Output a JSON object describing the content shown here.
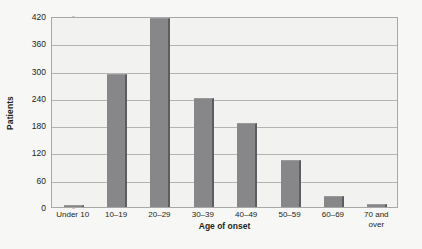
{
  "chart_data": {
    "type": "bar",
    "title": "",
    "xlabel": "Age of onset",
    "ylabel": "Patients",
    "categories": [
      "Under 10",
      "10–19",
      "20–29",
      "30–39",
      "40–49",
      "50–59",
      "60–69",
      "70 and\nover"
    ],
    "values": [
      5,
      292,
      415,
      239,
      184,
      103,
      25,
      6
    ],
    "ylim": [
      0,
      420
    ],
    "yticks": [
      0,
      60,
      120,
      180,
      240,
      300,
      360,
      420
    ],
    "ytick_labels": [
      "0",
      "60",
      "120",
      "180",
      "240",
      "300",
      "360",
      "420"
    ],
    "grid": true,
    "legend": "none",
    "bar_color": "#87878a",
    "bar_edge_color": "#5d5d61",
    "plot_background": "#f2f2f0",
    "page_background": "#f7f7f5",
    "axis_color": "#a8a8a6",
    "gridline_color": "#b4b4b2",
    "text_color": "#231f20"
  }
}
